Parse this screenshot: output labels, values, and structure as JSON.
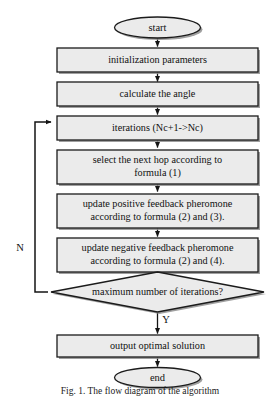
{
  "figure": {
    "type": "flowchart",
    "orientation": "top-to-bottom",
    "caption": "Fig. 1.  The flow diagram of the algorithm"
  },
  "nodes": {
    "start": {
      "label": "start",
      "shape": "terminator"
    },
    "init": {
      "label": "initialization parameters",
      "shape": "process"
    },
    "angle": {
      "label": "calculate the angle",
      "shape": "process"
    },
    "iterations": {
      "label": "iterations (Nc+1->Nc)",
      "shape": "process"
    },
    "select_hop": {
      "shape": "process",
      "line1": "select the next hop according to",
      "line2": "formula (1)"
    },
    "positive": {
      "shape": "process",
      "line1": "update positive feedback pheromone",
      "line2": "according to formula (2) and (3)."
    },
    "negative": {
      "shape": "process",
      "line1": "update negative feedback pheromone",
      "line2": "according to formula (2) and (4)."
    },
    "decision": {
      "label": "maximum number of iterations?",
      "shape": "decision"
    },
    "output": {
      "label": "output optimal solution",
      "shape": "process"
    },
    "end": {
      "label": "end",
      "shape": "terminator"
    }
  },
  "edge_labels": {
    "no": "N",
    "yes": "Y"
  },
  "colors": {
    "shape_fill": "#ebebeb",
    "shape_stroke": "#1b1b1b",
    "shadow": "#8e8e8e",
    "connector": "#141414",
    "text": "#111111",
    "background": "#ffffff"
  }
}
